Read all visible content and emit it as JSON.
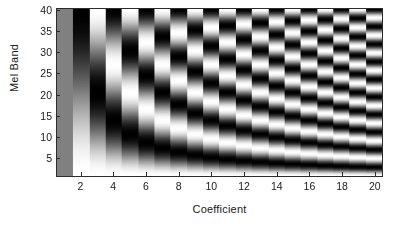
{
  "chart_data": {
    "type": "heatmap",
    "title": "",
    "xlabel": "Coefficient",
    "ylabel": "Mel Band",
    "xlim": [
      0.5,
      20.5
    ],
    "ylim": [
      0.5,
      40.5
    ],
    "xticks": [
      2,
      4,
      6,
      8,
      10,
      12,
      14,
      16,
      18,
      20
    ],
    "yticks": [
      5,
      10,
      15,
      20,
      25,
      30,
      35,
      40
    ],
    "xtick_labels": [
      "2",
      "4",
      "6",
      "8",
      "10",
      "12",
      "14",
      "16",
      "18",
      "20"
    ],
    "ytick_labels": [
      "5",
      "10",
      "15",
      "20",
      "25",
      "30",
      "35",
      "40"
    ],
    "grid": false,
    "legend": "none",
    "colormap": "gray",
    "colormap_low": "#000000",
    "colormap_high": "#ffffff",
    "n_coefficients": 20,
    "n_mel_bands": 40,
    "x_values": [
      1,
      2,
      3,
      4,
      5,
      6,
      7,
      8,
      9,
      10,
      11,
      12,
      13,
      14,
      15,
      16,
      17,
      18,
      19,
      20
    ],
    "y_values": [
      1,
      2,
      3,
      4,
      5,
      6,
      7,
      8,
      9,
      10,
      11,
      12,
      13,
      14,
      15,
      16,
      17,
      18,
      19,
      20,
      21,
      22,
      23,
      24,
      25,
      26,
      27,
      28,
      29,
      30,
      31,
      32,
      33,
      34,
      35,
      36,
      37,
      38,
      39,
      40
    ],
    "cell_formula": "z(band, coefficient) = cos(pi * (coefficient - 1) * (band - 0.5) / 40)",
    "z_range": [
      -1,
      1
    ]
  },
  "axes": {
    "x_label": "Coefficient",
    "y_label": "Mel Band"
  },
  "figure": {
    "background_color": "#ffffff",
    "axis_line_color": "#2b2b2b",
    "text_color": "#1a1a1a"
  }
}
